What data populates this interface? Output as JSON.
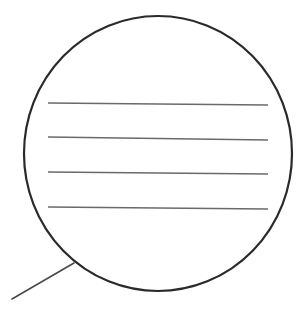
{
  "diagram": {
    "type": "callout-bubble",
    "colors": {
      "background": "#ffffff",
      "outline": "#2a2a2a",
      "lines": "#6a6a6a",
      "tail": "#4a4a4a"
    },
    "bubble": {
      "cx": 158,
      "cy": 153.5,
      "rx": 134,
      "ry": 137.5,
      "stroke_width": 2.2
    },
    "tail": {
      "x1": 12,
      "y1": 299,
      "x2": 74,
      "y2": 263,
      "stroke_width": 1.6
    },
    "lines": [
      {
        "x1": 48,
        "y1": 103,
        "x2": 268,
        "y2": 105
      },
      {
        "x1": 48,
        "y1": 137,
        "x2": 268,
        "y2": 140
      },
      {
        "x1": 48,
        "y1": 172,
        "x2": 268,
        "y2": 174
      },
      {
        "x1": 48,
        "y1": 207,
        "x2": 268,
        "y2": 209
      }
    ],
    "line_stroke_width": 1.3
  }
}
